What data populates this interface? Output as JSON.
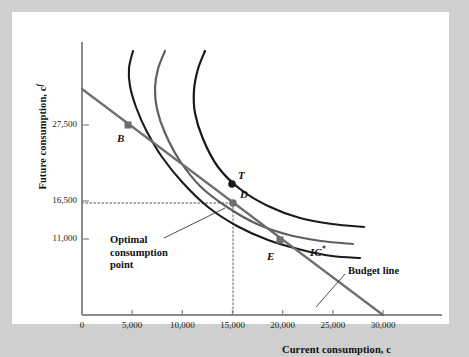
{
  "figure": {
    "background_color": "#cfcfcf",
    "panel_color": "#ffffff"
  },
  "chart_data": {
    "type": "line",
    "title": "",
    "xlabel": "Current consumption, c",
    "ylabel": "Future consumption, c",
    "ylabel_superscript": "f",
    "xlabel_italic": "c",
    "xlim": [
      0,
      33000
    ],
    "ylim": [
      0,
      44000
    ],
    "grid": false,
    "legend_position": "inline-annotations",
    "x_ticks": [
      {
        "value": 0,
        "label": "0"
      },
      {
        "value": 5000,
        "label": "5,000"
      },
      {
        "value": 10000,
        "label": "10,000"
      },
      {
        "value": 15000,
        "label": "15,000"
      },
      {
        "value": 20000,
        "label": "20,000"
      },
      {
        "value": 25000,
        "label": "25,000"
      },
      {
        "value": 30000,
        "label": "30,000"
      }
    ],
    "y_ticks": [
      {
        "value": 27500,
        "label": "27,500"
      },
      {
        "value": 16500,
        "label": "16,500"
      },
      {
        "value": 11000,
        "label": "11,000"
      }
    ],
    "series": [
      {
        "name": "indifference-curve-low",
        "color": "#1a1a1a",
        "style": "solid",
        "width": 2.1,
        "points_px": [
          [
            121,
            39
          ],
          [
            117,
            56
          ],
          [
            118,
            74
          ],
          [
            124,
            95
          ],
          [
            134,
            118
          ],
          [
            150,
            145
          ],
          [
            171,
            171
          ],
          [
            196,
            195
          ],
          [
            225,
            214
          ],
          [
            256,
            228
          ],
          [
            290,
            238
          ],
          [
            320,
            244
          ],
          [
            348,
            246
          ]
        ]
      },
      {
        "name": "indifference-curve-optimal",
        "color": "#5f5f5f",
        "style": "solid",
        "width": 2.2,
        "points_px": [
          [
            153,
            39
          ],
          [
            146,
            57
          ],
          [
            143,
            76
          ],
          [
            145,
            97
          ],
          [
            153,
            121
          ],
          [
            168,
            149
          ],
          [
            189,
            175
          ],
          [
            215,
            195
          ],
          [
            245,
            212
          ],
          [
            277,
            223
          ],
          [
            309,
            229
          ],
          [
            341,
            232
          ]
        ]
      },
      {
        "name": "indifference-curve-high",
        "color": "#1a1a1a",
        "style": "solid",
        "width": 2.2,
        "points_px": [
          [
            193,
            39
          ],
          [
            186,
            57
          ],
          [
            182,
            78
          ],
          [
            183,
            101
          ],
          [
            191,
            127
          ],
          [
            206,
            155
          ],
          [
            228,
            177
          ],
          [
            256,
            194
          ],
          [
            288,
            206
          ],
          [
            320,
            212
          ],
          [
            352,
            215
          ]
        ]
      },
      {
        "name": "budget-line",
        "color": "#6e6e6e",
        "style": "solid",
        "width": 2.2,
        "points_px": [
          [
            70,
            77
          ],
          [
            371,
            303
          ]
        ]
      }
    ],
    "points": [
      {
        "label": "B",
        "marker": "square",
        "color": "#6e6e6e",
        "x_px": 116,
        "y_px": 113,
        "label_dx": -11,
        "label_dy": 7
      },
      {
        "label": "T",
        "marker": "circle",
        "color": "#1a1a1a",
        "x_px": 220,
        "y_px": 172,
        "label_dx": 6,
        "label_dy": -15
      },
      {
        "label": "D",
        "marker": "circle",
        "color": "#6e6e6e",
        "x_px": 221,
        "y_px": 191,
        "label_dx": 7,
        "label_dy": -15
      },
      {
        "label": "E",
        "marker": "square",
        "color": "#6e6e6e",
        "x_px": 268,
        "y_px": 228,
        "label_dx": -13,
        "label_dy": 10
      }
    ],
    "guide_lines": [
      {
        "name": "horizontal-dotted-16500",
        "style": "dotted",
        "color": "#8c8c8c",
        "from_px": [
          70,
          191
        ],
        "to_px": [
          221,
          191
        ]
      },
      {
        "name": "vertical-dotted-15000",
        "style": "dotted",
        "color": "#8c8c8c",
        "from_px": [
          221,
          191
        ],
        "to_px": [
          221,
          303
        ]
      }
    ],
    "annotations": [
      {
        "name": "optimal-consumption-point",
        "lines": [
          "Optimal",
          "consumption",
          "point"
        ],
        "x_px": 98,
        "y_px": 222,
        "leader_from_px": [
          152,
          226
        ],
        "leader_to_px": [
          213,
          196
        ]
      },
      {
        "name": "budget-line-label",
        "lines": [
          "Budget line"
        ],
        "x_px": 336,
        "y_px": 253,
        "leader_from_px": [
          333,
          262
        ],
        "leader_to_px": [
          304,
          295
        ]
      }
    ],
    "curve_labels": [
      {
        "name": "ic-star",
        "text": "IC",
        "superscript": "*",
        "x_px": 298,
        "y_px": 232
      }
    ]
  }
}
